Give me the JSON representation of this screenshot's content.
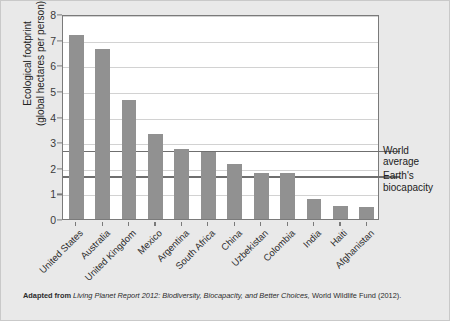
{
  "chart_data": {
    "type": "bar",
    "title": "",
    "xlabel": "",
    "ylabel": "Ecological footprint (global hectares per person)",
    "ylabel_line1": "Ecological footprint",
    "ylabel_line2": "(global hectares per person)",
    "ylim": [
      0,
      8
    ],
    "yticks": [
      0,
      1,
      2,
      3,
      4,
      5,
      6,
      7,
      8
    ],
    "ytick_labels": [
      "0",
      "1",
      "2",
      "3",
      "4",
      "5",
      "6",
      "7",
      "8"
    ],
    "grid": true,
    "legend": "none",
    "categories": [
      "United States",
      "Australia",
      "United Kingdom",
      "Mexico",
      "Argentina",
      "South Africa",
      "China",
      "Uzbekistan",
      "Colombia",
      "India",
      "Haiti",
      "Afghanistan"
    ],
    "values": [
      7.2,
      6.65,
      4.65,
      3.3,
      2.75,
      2.6,
      2.15,
      1.8,
      1.8,
      0.8,
      0.5,
      0.45
    ],
    "bar_color": "#919191",
    "reference_lines": [
      {
        "label_line1": "World",
        "label_line2": "average",
        "value": 2.75
      },
      {
        "label_line1": "Earth's",
        "label_line2": "biocapacity",
        "value": 1.75
      }
    ]
  },
  "caption": {
    "lead": "Adapted from",
    "source_italic": "Living Planet Report 2012: Biodiversity, Biocapacity, and Better Choices,",
    "tail": " World Wildlife Fund (2012)."
  }
}
